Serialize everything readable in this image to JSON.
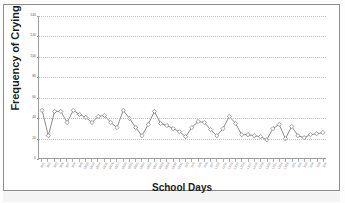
{
  "chart_data": {
    "type": "line",
    "title": "",
    "xlabel": "School Days",
    "ylabel": "Frequency of Crying",
    "ylim": [
      0,
      140
    ],
    "ytick_values": [
      0,
      20,
      40,
      60,
      80,
      100,
      120,
      140
    ],
    "ytick_labels": [
      "0",
      "20",
      "40",
      "60",
      "80",
      "100",
      "120",
      "140"
    ],
    "grid": true,
    "legend": "none",
    "marker": "diamond",
    "line_color": "#6e6e6e",
    "categories": [
      "10/1",
      "10/2",
      "10/3",
      "10/6",
      "10/7",
      "10/8",
      "10/9",
      "10/10",
      "10/13",
      "10/14",
      "10/15",
      "10/16",
      "10/17",
      "10/20",
      "10/21",
      "10/22",
      "10/23",
      "10/24",
      "10/27",
      "10/28",
      "10/29",
      "10/30",
      "10/31",
      "11/3",
      "11/4",
      "11/5",
      "11/6",
      "11/7",
      "11/10",
      "11/11",
      "11/12",
      "11/13",
      "11/14",
      "11/17",
      "11/18",
      "11/19",
      "11/20",
      "11/21",
      "11/24",
      "11/25",
      "12/1",
      "12/2",
      "12/3",
      "12/4",
      "12/5",
      "12/8"
    ],
    "series": [
      {
        "name": "Frequency of Crying",
        "values": [
          47,
          22,
          46,
          46,
          35,
          47,
          43,
          40,
          35,
          41,
          42,
          35,
          30,
          47,
          39,
          30,
          22,
          33,
          46,
          34,
          32,
          29,
          26,
          21,
          30,
          36,
          35,
          28,
          22,
          29,
          41,
          34,
          23,
          23,
          22,
          21,
          18,
          29,
          33,
          19,
          31,
          22,
          20,
          23,
          24,
          25
        ]
      }
    ]
  },
  "figure": {
    "y_axis_title": "Frequency of Crying",
    "x_axis_title": "School Days"
  }
}
